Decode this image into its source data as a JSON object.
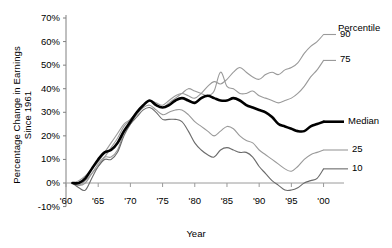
{
  "chart_data": {
    "type": "line",
    "title": "",
    "xlabel": "Year",
    "ylabel": "Percentage Change in Earnings Since 1961",
    "xlim": [
      1960,
      2001
    ],
    "ylim": [
      -10,
      75
    ],
    "ytick_labels": [
      "70%",
      "60%",
      "50%",
      "40%",
      "30%",
      "20%",
      "10%",
      "0%",
      "-10%"
    ],
    "ytick_values": [
      70,
      60,
      50,
      40,
      30,
      20,
      10,
      0,
      -10
    ],
    "xtick_labels": [
      "'60",
      "'65",
      "'70",
      "'75",
      "'80",
      "'85",
      "'90",
      "'95",
      "'00"
    ],
    "xtick_values": [
      1960,
      1965,
      1970,
      1975,
      1980,
      1985,
      1990,
      1995,
      2000
    ],
    "grid": false,
    "legend_position": "right-inline",
    "legend_title": "Percentile",
    "series": [
      {
        "name": "90",
        "label": "90",
        "color": "#9a9a9a",
        "width": 1.1,
        "x": [
          1961,
          1962,
          1963,
          1964,
          1965,
          1966,
          1967,
          1968,
          1969,
          1970,
          1971,
          1972,
          1973,
          1974,
          1975,
          1976,
          1977,
          1978,
          1979,
          1980,
          1981,
          1982,
          1983,
          1984,
          1985,
          1986,
          1987,
          1988,
          1989,
          1990,
          1991,
          1992,
          1993,
          1994,
          1995,
          1996,
          1997,
          1998,
          1999,
          2000
        ],
        "values": [
          0,
          1,
          3,
          6,
          9,
          13,
          17,
          21,
          25,
          27,
          30,
          33,
          35,
          34,
          33,
          35,
          37,
          38,
          37,
          36,
          38,
          41,
          43,
          42,
          44,
          47,
          49,
          47,
          45,
          44,
          46,
          47,
          46,
          48,
          49,
          51,
          55,
          58,
          60,
          63
        ]
      },
      {
        "name": "75",
        "label": "75",
        "color": "#9a9a9a",
        "width": 1.1,
        "x": [
          1961,
          1962,
          1963,
          1964,
          1965,
          1966,
          1967,
          1968,
          1969,
          1970,
          1971,
          1972,
          1973,
          1974,
          1975,
          1976,
          1977,
          1978,
          1979,
          1980,
          1981,
          1982,
          1983,
          1984,
          1985,
          1986,
          1987,
          1988,
          1989,
          1990,
          1991,
          1992,
          1993,
          1994,
          1995,
          1996,
          1997,
          1998,
          1999,
          2000
        ],
        "values": [
          0,
          -1,
          1,
          4,
          7,
          11,
          15,
          19,
          24,
          27,
          30,
          33,
          35,
          33,
          32,
          34,
          36,
          38,
          40,
          39,
          38,
          37,
          39,
          47,
          41,
          40,
          38,
          38,
          39,
          37,
          36,
          35,
          34,
          35,
          36,
          38,
          41,
          45,
          48,
          52
        ]
      },
      {
        "name": "Median",
        "label": "Median",
        "color": "#000000",
        "width": 2.6,
        "x": [
          1961,
          1962,
          1963,
          1964,
          1965,
          1966,
          1967,
          1968,
          1969,
          1970,
          1971,
          1972,
          1973,
          1974,
          1975,
          1976,
          1977,
          1978,
          1979,
          1980,
          1981,
          1982,
          1983,
          1984,
          1985,
          1986,
          1987,
          1988,
          1989,
          1990,
          1991,
          1992,
          1993,
          1994,
          1995,
          1996,
          1997,
          1998,
          1999,
          2000
        ],
        "values": [
          0,
          0,
          2,
          6,
          10,
          13,
          14,
          17,
          22,
          26,
          30,
          33,
          35,
          33,
          32,
          33,
          35,
          36,
          35,
          34,
          36,
          37,
          36,
          35,
          35,
          36,
          35,
          33,
          32,
          31,
          30,
          28,
          25,
          24,
          23,
          22,
          22,
          24,
          25,
          26
        ]
      },
      {
        "name": "25",
        "label": "25",
        "color": "#9a9a9a",
        "width": 1.1,
        "x": [
          1961,
          1962,
          1963,
          1964,
          1965,
          1966,
          1967,
          1968,
          1969,
          1970,
          1971,
          1972,
          1973,
          1974,
          1975,
          1976,
          1977,
          1978,
          1979,
          1980,
          1981,
          1982,
          1983,
          1984,
          1985,
          1986,
          1987,
          1988,
          1989,
          1990,
          1991,
          1992,
          1993,
          1994,
          1995,
          1996,
          1997,
          1998,
          1999,
          2000
        ],
        "values": [
          0,
          -1,
          0,
          4,
          8,
          11,
          11,
          14,
          21,
          25,
          29,
          32,
          33,
          31,
          29,
          30,
          31,
          31,
          29,
          26,
          24,
          22,
          20,
          22,
          24,
          23,
          20,
          18,
          17,
          14,
          12,
          10,
          8,
          6,
          5,
          7,
          10,
          12,
          13,
          14
        ]
      },
      {
        "name": "10",
        "label": "10",
        "color": "#6b6b6b",
        "width": 1.1,
        "x": [
          1961,
          1962,
          1963,
          1964,
          1965,
          1966,
          1967,
          1968,
          1969,
          1970,
          1971,
          1972,
          1973,
          1974,
          1975,
          1976,
          1977,
          1978,
          1979,
          1980,
          1981,
          1982,
          1983,
          1984,
          1985,
          1986,
          1987,
          1988,
          1989,
          1990,
          1991,
          1992,
          1993,
          1994,
          1995,
          1996,
          1997,
          1998,
          1999,
          2000
        ],
        "values": [
          0,
          -2,
          -3,
          2,
          7,
          10,
          10,
          13,
          20,
          25,
          28,
          31,
          32,
          30,
          27,
          27,
          27,
          26,
          22,
          17,
          14,
          12,
          11,
          14,
          15,
          14,
          13,
          13,
          11,
          7,
          4,
          1,
          -1,
          -3,
          -3,
          -2,
          0,
          1,
          2,
          6
        ]
      }
    ],
    "annotations": [
      {
        "text": "Percentile",
        "series": "legend-title"
      },
      {
        "text": "90",
        "series": "90"
      },
      {
        "text": "75",
        "series": "75"
      },
      {
        "text": "Median",
        "series": "Median"
      },
      {
        "text": "25",
        "series": "25"
      },
      {
        "text": "10",
        "series": "10"
      }
    ]
  },
  "legend": {
    "title": "Percentile",
    "p90": "90",
    "p75": "75",
    "median": "Median",
    "p25": "25",
    "p10": "10"
  },
  "axes": {
    "ylabel": "Percentage Change in Earnings Since 1961",
    "xlabel": "Year"
  }
}
